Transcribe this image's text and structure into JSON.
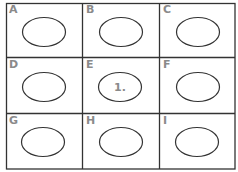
{
  "diagram": {
    "type": "3x3 grid of labeled cells, each containing an ellipse",
    "colors": {
      "line": "#333333",
      "letter": "#8a8a8a",
      "background": "#ffffff"
    },
    "cells": [
      {
        "letter": "A",
        "ellipse_text": ""
      },
      {
        "letter": "B",
        "ellipse_text": ""
      },
      {
        "letter": "C",
        "ellipse_text": ""
      },
      {
        "letter": "D",
        "ellipse_text": ""
      },
      {
        "letter": "E",
        "ellipse_text": "1."
      },
      {
        "letter": "F",
        "ellipse_text": ""
      },
      {
        "letter": "G",
        "ellipse_text": ""
      },
      {
        "letter": "H",
        "ellipse_text": ""
      },
      {
        "letter": "I",
        "ellipse_text": ""
      }
    ]
  }
}
